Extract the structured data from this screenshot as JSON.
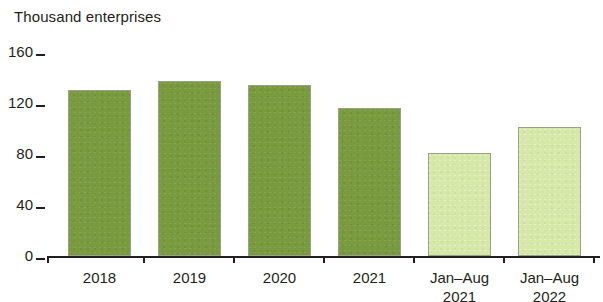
{
  "chart_data": {
    "type": "bar",
    "title": "",
    "unit_label": "Thousand enterprises",
    "xlabel": "",
    "ylabel": "Thousand enterprises",
    "ylim": [
      0,
      160
    ],
    "ytick_values": [
      160,
      120,
      80,
      40,
      0
    ],
    "ytick_labels": [
      "160",
      "120",
      "80",
      "40",
      "0"
    ],
    "grid": false,
    "legend": "none",
    "categories": [
      "2018",
      "2019",
      "2020",
      "2021",
      "Jan–Aug 2021",
      "Jan–Aug 2022"
    ],
    "category_lines": [
      {
        "line1": "2018",
        "line2": ""
      },
      {
        "line1": "2019",
        "line2": ""
      },
      {
        "line1": "2020",
        "line2": ""
      },
      {
        "line1": "2021",
        "line2": ""
      },
      {
        "line1": "Jan–Aug",
        "line2": "2021"
      },
      {
        "line1": "Jan–Aug",
        "line2": "2022"
      }
    ],
    "values": [
      130,
      137,
      134,
      116,
      81,
      101
    ],
    "bar_styles": [
      "dark",
      "dark",
      "dark",
      "dark",
      "light",
      "light"
    ],
    "colors": {
      "bar_dark": "#7a9a40",
      "bar_light": "#d7e9a8",
      "bar_outline": "#9aa18a",
      "axis": "#231f20",
      "text": "#231f20",
      "background": "#ffffff"
    }
  }
}
